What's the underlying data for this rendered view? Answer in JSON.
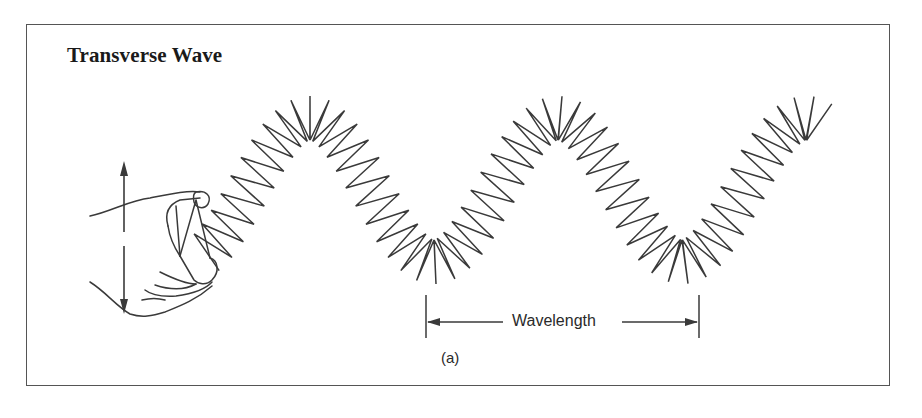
{
  "figure": {
    "title": "Transverse Wave",
    "wavelength_label": "Wavelength",
    "sub_label": "(a)"
  },
  "icons": {
    "hand": "hand-holding-spring",
    "motion_arrow": "vertical-double-arrow"
  },
  "colors": {
    "line": "#3a3a3a",
    "frame": "#555555",
    "background": "#ffffff"
  },
  "wave": {
    "x_start": 205,
    "x_end": 822,
    "center_y": 190,
    "amplitude": 72,
    "wavelength_px": 248,
    "phase_peak_x": 310,
    "zigzag_amplitude": 22,
    "zigzag_pitch": 10
  },
  "wavelength_marker": {
    "x_left": 426,
    "x_right": 699,
    "y_line": 322,
    "y_top": 295,
    "y_bottom": 338
  }
}
